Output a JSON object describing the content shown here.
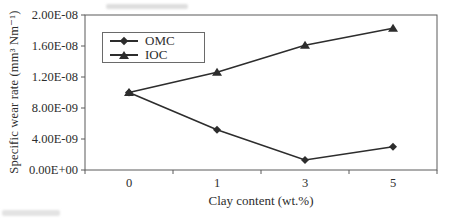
{
  "figure": {
    "background": "#ffffff",
    "frame_color": "#5a5a5a",
    "text_color": "#2d2d2d"
  },
  "chart_data": {
    "type": "line",
    "title": "",
    "xlabel": "Clay content (wt.%)",
    "ylabel": "Specific wear rate (mm³ Nm⁻¹)",
    "categories": [
      "0",
      "1",
      "3",
      "5"
    ],
    "series": [
      {
        "name": "OMC",
        "marker": "diamond",
        "values": [
          1e-08,
          5.2e-09,
          1.3e-09,
          3e-09
        ]
      },
      {
        "name": "IOC",
        "marker": "triangle",
        "values": [
          1e-08,
          1.26e-08,
          1.61e-08,
          1.83e-08
        ]
      }
    ],
    "ylim": [
      0,
      2e-08
    ],
    "ytick_step": 4e-09,
    "ytick_labels": [
      "0.00E+00",
      "4.00E-09",
      "8.00E-09",
      "1.20E-08",
      "1.60E-08",
      "2.00E-08"
    ],
    "x_axis_type": "category",
    "grid": false,
    "legend_position": "upper-left",
    "line_color": "#2d2d2d",
    "marker_color": "#2d2d2d"
  }
}
